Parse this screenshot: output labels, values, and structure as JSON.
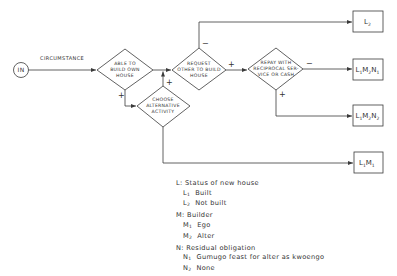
{
  "diagram": {
    "start_node": {
      "label": "IN"
    },
    "input_label": "CIRCUMSTANCE",
    "decisions": [
      {
        "id": "able",
        "lines": [
          "ABLE TO",
          "BUILD OWN",
          "HOUSE"
        ]
      },
      {
        "id": "choose",
        "lines": [
          "CHOOSE",
          "ALTERNATIVE",
          "ACTIVITY"
        ]
      },
      {
        "id": "request",
        "lines": [
          "REQUEST",
          "OTHER TO BUILD",
          "HOUSE"
        ]
      },
      {
        "id": "repay",
        "lines": [
          "REPAY WITH",
          "RECIPROCAL SER-",
          "VICE OR CASH"
        ]
      }
    ],
    "outcomes": [
      {
        "id": "L2",
        "parts": [
          {
            "main": "L",
            "sub": "2"
          }
        ]
      },
      {
        "id": "L1M2N1",
        "parts": [
          {
            "main": "L",
            "sub": "1"
          },
          {
            "main": "M",
            "sub": "2"
          },
          {
            "main": "N",
            "sub": "1"
          }
        ]
      },
      {
        "id": "L1M2N2",
        "parts": [
          {
            "main": "L",
            "sub": "1"
          },
          {
            "main": "M",
            "sub": "2"
          },
          {
            "main": "N",
            "sub": "2"
          }
        ]
      },
      {
        "id": "L1M1",
        "parts": [
          {
            "main": "L",
            "sub": "1"
          },
          {
            "main": "M",
            "sub": "1"
          }
        ]
      }
    ],
    "edge_signs": {
      "able_to_choose": "+",
      "choose_to_request": "+",
      "request_to_L2": "−",
      "request_to_repay": "+",
      "repay_to_L1M2N1": "−",
      "repay_to_L1M2N2": "+"
    }
  },
  "legend": {
    "groups": [
      {
        "key": "L:",
        "title": "Status of new house",
        "items": [
          {
            "sym": "L",
            "sub": "1",
            "text": "Built"
          },
          {
            "sym": "L",
            "sub": "2",
            "text": "Not built"
          }
        ]
      },
      {
        "key": "M:",
        "title": "Builder",
        "items": [
          {
            "sym": "M",
            "sub": "1",
            "text": "Ego"
          },
          {
            "sym": "M",
            "sub": "2",
            "text": "Alter"
          }
        ]
      },
      {
        "key": "N:",
        "title": "Residual obligation",
        "items": [
          {
            "sym": "N",
            "sub": "1",
            "text": "Gumugo feast for alter as kwoengo"
          },
          {
            "sym": "N",
            "sub": "2",
            "text": "None"
          }
        ]
      }
    ]
  },
  "colors": {
    "line": "#3a3a3a",
    "text": "#333333",
    "background": "#ffffff"
  }
}
